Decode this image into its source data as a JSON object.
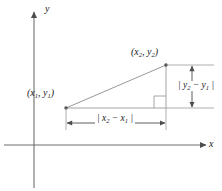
{
  "figure": {
    "background_color": "#ffffff",
    "line_color": "#8c8c8c",
    "axis_color": "#6e6e6e",
    "text_color": "#1a1a1a"
  },
  "axes": {
    "x_label": "x",
    "y_label": "y",
    "origin_x": 34,
    "origin_y": 145
  },
  "points": [
    {
      "name": "point-1",
      "label_html": "(x<sub>1</sub>, y<sub>1</sub>)",
      "label_text": "(x1, y1)",
      "px": 66,
      "py": 108
    },
    {
      "name": "point-2",
      "label_html": "(x<sub>2</sub>, y<sub>2</sub>)",
      "label_text": "(x2, y2)",
      "px": 166,
      "py": 65
    }
  ],
  "dimensions": {
    "horizontal": {
      "label_html": "| x<sub>2</sub> &minus; x<sub>1</sub> |",
      "label_text": "|x2 - x1|"
    },
    "vertical": {
      "label_html": "| y<sub>2</sub> &minus; y<sub>1</sub> |",
      "label_text": "|y2 - y1|"
    }
  },
  "markers": {
    "right_angle": "right-angle-square"
  }
}
